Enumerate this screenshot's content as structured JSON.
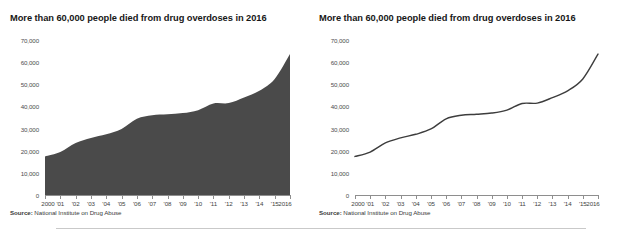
{
  "panels": [
    {
      "title": "More than 60,000 people died from drug overdoses in 2016",
      "source_label": "Source:",
      "source_text": " National Institute on Drug Abuse"
    },
    {
      "title": "More than 60,000 people died from drug overdoses in 2016",
      "source_label": "Source:",
      "source_text": " National Institute on Drug Abuse"
    }
  ],
  "colors": {
    "area_fill": "#4a4a4a",
    "line_stroke": "#3d3d3d",
    "axis": "#8e8e8e",
    "grid": "#e6e6e6",
    "divider": "#c9c9c9",
    "text": "#1b1b1b"
  },
  "chart_data": [
    {
      "type": "area",
      "title": "More than 60,000 people died from drug overdoses in 2016",
      "xlabel": "",
      "ylabel": "",
      "source": "Source: National Institute on Drug Abuse",
      "grid": false,
      "legend": "none",
      "ylim": [
        0,
        70000
      ],
      "yticks": [
        0,
        10000,
        20000,
        30000,
        40000,
        50000,
        60000,
        70000
      ],
      "ytick_labels": [
        "0",
        "10,000",
        "20,000",
        "30,000",
        "40,000",
        "50,000",
        "60,000",
        "70,000"
      ],
      "categories": [
        "2000",
        "'01",
        "'02",
        "'03",
        "'04",
        "'05",
        "'06",
        "'07",
        "'08",
        "'09",
        "'10",
        "'11",
        "'12",
        "'13",
        "'14",
        "'15",
        "2016"
      ],
      "x": [
        2000,
        2001,
        2002,
        2003,
        2004,
        2005,
        2006,
        2007,
        2008,
        2009,
        2010,
        2011,
        2012,
        2013,
        2014,
        2015,
        2016
      ],
      "values": [
        17415,
        19394,
        23518,
        25785,
        27424,
        29813,
        34425,
        36010,
        36450,
        37004,
        38329,
        41340,
        41502,
        43982,
        47055,
        52404,
        63632
      ]
    },
    {
      "type": "line",
      "title": "More than 60,000 people died from drug overdoses in 2016",
      "xlabel": "",
      "ylabel": "",
      "source": "Source: National Institute on Drug Abuse",
      "grid": false,
      "legend": "none",
      "ylim": [
        0,
        70000
      ],
      "yticks": [
        0,
        10000,
        20000,
        30000,
        40000,
        50000,
        60000,
        70000
      ],
      "ytick_labels": [
        "0",
        "10,000",
        "20,000",
        "30,000",
        "40,000",
        "50,000",
        "60,000",
        "70,000"
      ],
      "categories": [
        "2000",
        "'01",
        "'02",
        "'03",
        "'04",
        "'05",
        "'06",
        "'07",
        "'08",
        "'09",
        "'10",
        "'11",
        "'12",
        "'13",
        "'14",
        "'15",
        "2016"
      ],
      "x": [
        2000,
        2001,
        2002,
        2003,
        2004,
        2005,
        2006,
        2007,
        2008,
        2009,
        2010,
        2011,
        2012,
        2013,
        2014,
        2015,
        2016
      ],
      "values": [
        17415,
        19394,
        23518,
        25785,
        27424,
        29813,
        34425,
        36010,
        36450,
        37004,
        38329,
        41340,
        41502,
        43982,
        47055,
        52404,
        63632
      ]
    }
  ]
}
